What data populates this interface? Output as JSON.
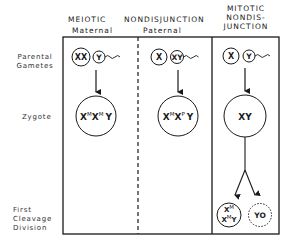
{
  "headers": {
    "meiotic_line1": "MEIOTIC",
    "nondisjunction_line1": "NONDISJUNCTION",
    "maternal": "Maternal",
    "paternal": "Paternal",
    "mitotic_line1": "MITOTIC",
    "mitotic_line2": "NONDIS-",
    "mitotic_line3": "JUNCTION"
  },
  "row_labels": {
    "gametes_line1": "Parental",
    "gametes_line2": "Gametes",
    "zygote": "Zygote",
    "cleavage_line1": "First",
    "cleavage_line2": "Cleavage",
    "cleavage_line3": "Division"
  },
  "panels": {
    "maternal": {
      "egg": "XX",
      "sperm": "Y",
      "zygote": {
        "parts": [
          {
            "base": "X",
            "sup": "M"
          },
          {
            "base": "X",
            "sup": "M"
          },
          {
            "base": "Y",
            "sup": ""
          }
        ]
      }
    },
    "paternal": {
      "egg": "X",
      "sperm": "XY",
      "zygote": {
        "parts": [
          {
            "base": "X",
            "sup": "M"
          },
          {
            "base": "X",
            "sup": "P"
          },
          {
            "base": "Y",
            "sup": ""
          }
        ]
      }
    },
    "mitotic": {
      "egg": "X",
      "sperm": "Y",
      "zygote": "XY",
      "daughter_left": {
        "top": {
          "base": "X",
          "sup": "M"
        },
        "bottom": [
          {
            "base": "X",
            "sup": "M"
          },
          {
            "base": "Y",
            "sup": ""
          }
        ]
      },
      "daughter_right": "YO"
    }
  }
}
